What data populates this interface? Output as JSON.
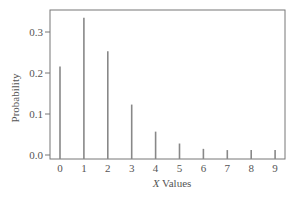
{
  "chart_data": {
    "type": "bar",
    "style": "stem",
    "title": "",
    "xlabel_italic": "X",
    "xlabel_rest": " Values",
    "xlabel": "X Values",
    "ylabel": "Probability",
    "categories": [
      "0",
      "1",
      "2",
      "3",
      "4",
      "5",
      "6",
      "7",
      "8",
      "9"
    ],
    "values": [
      0.216,
      0.335,
      0.253,
      0.123,
      0.057,
      0.028,
      0.015,
      0.012,
      0.012,
      0.012
    ],
    "yticks": [
      "0.0",
      "0.1",
      "0.2",
      "0.3"
    ],
    "ylim": [
      -0.01,
      0.355
    ],
    "grid": false,
    "legend": null,
    "bar_color": "#888888"
  }
}
